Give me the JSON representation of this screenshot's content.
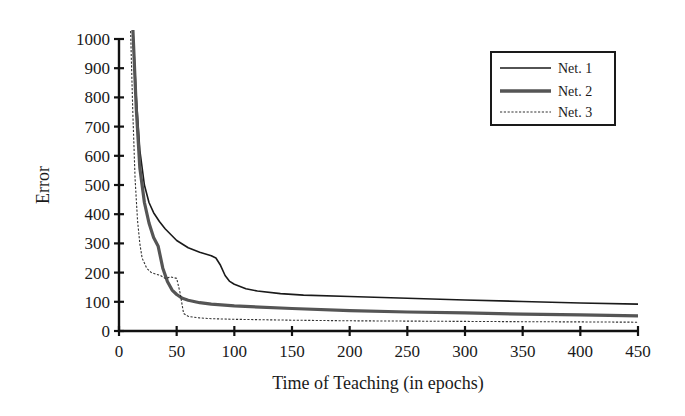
{
  "chart_data": {
    "type": "line",
    "title": "",
    "xlabel": "Time of Teaching (in epochs)",
    "ylabel": "Error",
    "xlim": [
      0,
      450
    ],
    "ylim": [
      0,
      1000
    ],
    "xticks": [
      0,
      50,
      100,
      150,
      200,
      250,
      300,
      350,
      400,
      450
    ],
    "yticks": [
      0,
      100,
      200,
      300,
      400,
      500,
      600,
      700,
      800,
      900,
      1000
    ],
    "grid": false,
    "legend_position": "upper right",
    "series": [
      {
        "name": "Net. 1",
        "style": "solid-thin",
        "color": "#1a1a1a",
        "x": [
          12,
          15,
          18,
          22,
          26,
          30,
          35,
          40,
          50,
          60,
          70,
          80,
          84,
          88,
          92,
          96,
          100,
          110,
          120,
          140,
          160,
          200,
          250,
          300,
          350,
          400,
          450
        ],
        "y": [
          1040,
          800,
          620,
          500,
          440,
          405,
          375,
          350,
          310,
          285,
          270,
          258,
          250,
          225,
          190,
          170,
          160,
          145,
          137,
          128,
          123,
          118,
          112,
          106,
          101,
          96,
          92
        ]
      },
      {
        "name": "Net. 2",
        "style": "solid-thick",
        "color": "#555555",
        "x": [
          12,
          15,
          18,
          22,
          26,
          30,
          34,
          38,
          42,
          46,
          50,
          55,
          60,
          70,
          80,
          100,
          150,
          200,
          250,
          300,
          350,
          400,
          450
        ],
        "y": [
          1040,
          760,
          560,
          440,
          370,
          320,
          290,
          215,
          170,
          140,
          125,
          112,
          105,
          97,
          92,
          86,
          77,
          70,
          65,
          62,
          58,
          55,
          52
        ]
      },
      {
        "name": "Net. 3",
        "style": "dashed",
        "color": "#333333",
        "x": [
          10,
          12,
          14,
          16,
          18,
          20,
          24,
          28,
          32,
          36,
          40,
          45,
          50,
          53,
          56,
          60,
          70,
          80,
          100,
          150,
          200,
          250,
          300,
          350,
          400,
          450
        ],
        "y": [
          1040,
          750,
          520,
          380,
          300,
          250,
          215,
          200,
          195,
          190,
          180,
          185,
          180,
          130,
          60,
          50,
          45,
          42,
          40,
          37,
          35,
          34,
          33,
          32,
          31,
          30
        ]
      }
    ]
  },
  "legend": {
    "items": [
      {
        "label": "Net. 1"
      },
      {
        "label": "Net. 2"
      },
      {
        "label": "Net. 3"
      }
    ]
  }
}
